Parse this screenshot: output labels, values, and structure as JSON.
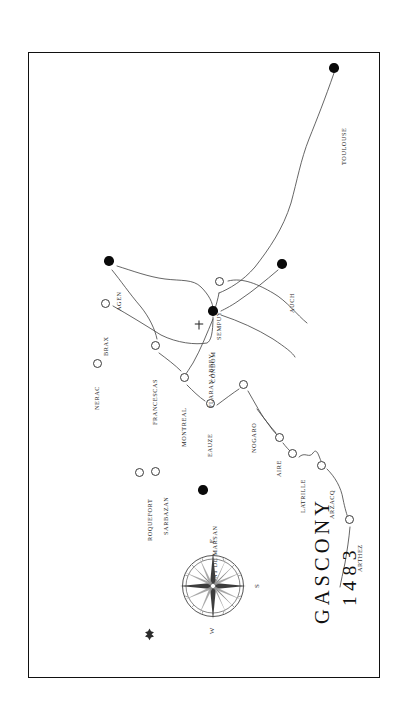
{
  "document": {
    "kind": "historical-map",
    "orientation": "rotated-90-ccw",
    "title_name": "GASCONY",
    "title_year": "1483",
    "background_color": "#ffffff",
    "frame_color": "#111111",
    "ink_color": "#2a2a2a"
  },
  "legend_semantics": {
    "major_marker": "filled-black-disc",
    "minor_marker": "hollow-circle",
    "abbey_marker": "latin-cross"
  },
  "compass": {
    "name": "compass-rose",
    "labels": {
      "top": "E",
      "right": "S",
      "bottom": "W",
      "left_marker": "north-fleur-de-lis"
    },
    "note_top_is_east": true
  },
  "places": [
    {
      "name": "TOULOUSE",
      "type": "major",
      "x": 305,
      "y": 15,
      "lx": 311,
      "ly": 112
    },
    {
      "name": "AGEN",
      "type": "major",
      "x": 80,
      "y": 208,
      "lx": 86,
      "ly": 258
    },
    {
      "name": "BRAX",
      "type": "minor",
      "x": 76,
      "y": 250,
      "lx": 73,
      "ly": 303
    },
    {
      "name": "NERAC",
      "type": "minor",
      "x": 68,
      "y": 310,
      "lx": 64,
      "ly": 357
    },
    {
      "name": "FRANCESCAS",
      "type": "minor",
      "x": 126,
      "y": 292,
      "lx": 122,
      "ly": 372
    },
    {
      "name": "CONDOM",
      "type": "major",
      "x": 184,
      "y": 258,
      "lx": 180,
      "ly": 330
    },
    {
      "name": "SEMPUY",
      "type": "minor",
      "x": 190,
      "y": 228,
      "lx": 186,
      "ly": 287
    },
    {
      "name": "AUCH",
      "type": "major",
      "x": 253,
      "y": 211,
      "lx": 259,
      "ly": 260
    },
    {
      "name": "FLARAN ABBEY",
      "type": "abbey",
      "x": 170,
      "y": 272,
      "lx": 178,
      "ly": 355
    },
    {
      "name": "MONTREAL",
      "type": "minor",
      "x": 155,
      "y": 324,
      "lx": 151,
      "ly": 394
    },
    {
      "name": "EAUZE",
      "type": "minor",
      "x": 181,
      "y": 350,
      "lx": 177,
      "ly": 404
    },
    {
      "name": "NOGARO",
      "type": "minor",
      "x": 214,
      "y": 331,
      "lx": 221,
      "ly": 400
    },
    {
      "name": "ROQUEFORT",
      "type": "minor",
      "x": 110,
      "y": 419,
      "lx": 117,
      "ly": 488
    },
    {
      "name": "SARBAZAN",
      "type": "minor",
      "x": 126,
      "y": 418,
      "lx": 133,
      "ly": 482
    },
    {
      "name": "MONT DE MARSAN",
      "type": "major",
      "x": 174,
      "y": 437,
      "lx": 182,
      "ly": 537
    },
    {
      "name": "AIRE",
      "type": "minor",
      "x": 250,
      "y": 384,
      "lx": 246,
      "ly": 424
    },
    {
      "name": "LATRILLE",
      "type": "minor",
      "x": 263,
      "y": 400,
      "lx": 270,
      "ly": 460
    },
    {
      "name": "ARZACQ",
      "type": "minor",
      "x": 292,
      "y": 412,
      "lx": 299,
      "ly": 466
    },
    {
      "name": "ARTHEZ",
      "type": "minor",
      "x": 320,
      "y": 466,
      "lx": 327,
      "ly": 519
    }
  ],
  "rivers": [
    {
      "name": "garonne-toulouse-to-condom",
      "path": "M 305 20 C 296 46 288 66 280 86 C 272 106 268 128 262 150 C 254 176 240 196 226 214 C 214 228 200 236 190 240"
    },
    {
      "name": "condom-to-sempuy",
      "path": "M 190 240 C 189 246 187 252 186 256"
    },
    {
      "name": "sempuy-east-loop",
      "path": "M 199 228 C 214 224 230 232 244 240 C 258 248 268 262 278 270"
    },
    {
      "name": "auch-to-condom-branch",
      "path": "M 249 217 C 236 228 224 238 212 246 C 204 252 196 256 192 258"
    },
    {
      "name": "agen-to-condom-north",
      "path": "M 88 213 C 104 218 120 224 136 226 C 152 228 164 226 172 234 C 180 242 184 250 184 256"
    },
    {
      "name": "agen-brax-francescas",
      "path": "M 83 217 C 92 228 100 240 112 254 C 120 264 126 276 128 286"
    },
    {
      "name": "brax-to-condom",
      "path": "M 84 253 C 100 262 116 272 132 282 C 148 290 166 292 178 290 C 182 288 184 280 184 264"
    },
    {
      "name": "francescas-to-montreal",
      "path": "M 130 300 C 138 306 146 312 152 318"
    },
    {
      "name": "condom-south-to-montreal",
      "path": "M 184 266 C 178 280 172 296 164 310 C 160 316 158 320 156 322"
    },
    {
      "name": "montreal-to-eauze",
      "path": "M 158 332 C 164 338 170 344 176 348"
    },
    {
      "name": "eauze-to-nogaro",
      "path": "M 188 352 C 196 346 204 340 210 336"
    },
    {
      "name": "condom-east-lobe",
      "path": "M 192 262 C 210 268 228 276 244 286 C 256 294 264 300 266 304"
    },
    {
      "name": "nogaro-to-aire",
      "path": "M 219 338 C 226 350 232 362 240 372 C 244 378 248 382 250 384"
    },
    {
      "name": "aire-to-latrille",
      "path": "M 254 390 C 257 394 260 397 262 399"
    },
    {
      "name": "latrille-to-arzacq",
      "path": "M 270 404 C 276 398 280 406 284 400 C 288 394 290 404 292 408"
    },
    {
      "name": "arzacq-to-arthez",
      "path": "M 298 416 C 306 424 312 434 314 446 C 316 456 318 462 319 465"
    },
    {
      "name": "arthez-south-tail",
      "path": "M 321 474 C 320 486 318 498 316 510 C 314 520 312 528 311 534"
    },
    {
      "name": "aire-north-tail",
      "path": "M 247 380 C 240 372 234 364 228 356"
    }
  ]
}
